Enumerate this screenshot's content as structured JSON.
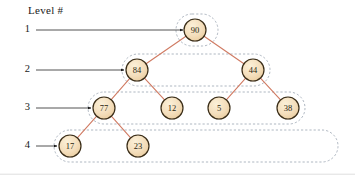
{
  "figure": {
    "caption_label": "Level #",
    "levels": [
      {
        "number": "1",
        "arrow_from_x": 36,
        "arrow_to_x": 183,
        "y": 30
      },
      {
        "number": "2",
        "arrow_from_x": 36,
        "arrow_to_x": 124,
        "y": 70
      },
      {
        "number": "3",
        "arrow_from_x": 36,
        "arrow_to_x": 91,
        "y": 108
      },
      {
        "number": "4",
        "arrow_from_x": 36,
        "arrow_to_x": 57,
        "y": 146
      }
    ],
    "nodes": [
      {
        "id": "n90",
        "label": "90",
        "cx": 195,
        "cy": 30,
        "level": 1
      },
      {
        "id": "n84",
        "label": "84",
        "cx": 137,
        "cy": 70,
        "level": 2
      },
      {
        "id": "n44",
        "label": "44",
        "cx": 253,
        "cy": 70,
        "level": 2
      },
      {
        "id": "n77",
        "label": "77",
        "cx": 104,
        "cy": 108,
        "level": 3
      },
      {
        "id": "n12",
        "label": "12",
        "cx": 172,
        "cy": 108,
        "level": 3
      },
      {
        "id": "n5",
        "label": "5",
        "cx": 219,
        "cy": 108,
        "level": 3
      },
      {
        "id": "n38",
        "label": "38",
        "cx": 288,
        "cy": 108,
        "level": 3
      },
      {
        "id": "n17",
        "label": "17",
        "cx": 70,
        "cy": 146,
        "level": 4
      },
      {
        "id": "n23",
        "label": "23",
        "cx": 138,
        "cy": 146,
        "level": 4
      }
    ],
    "edges": [
      {
        "from": "n90",
        "to": "n84"
      },
      {
        "from": "n90",
        "to": "n44"
      },
      {
        "from": "n84",
        "to": "n77"
      },
      {
        "from": "n84",
        "to": "n12"
      },
      {
        "from": "n44",
        "to": "n5"
      },
      {
        "from": "n44",
        "to": "n38"
      },
      {
        "from": "n77",
        "to": "n17"
      },
      {
        "from": "n77",
        "to": "n23"
      }
    ],
    "level_enclosures": [
      {
        "level": 1,
        "x": 176,
        "y": 14,
        "width": 42,
        "height": 32
      },
      {
        "level": 2,
        "x": 122,
        "y": 54,
        "width": 148,
        "height": 32
      },
      {
        "level": 3,
        "x": 88,
        "y": 92,
        "width": 217,
        "height": 32
      },
      {
        "level": 4,
        "x": 54,
        "y": 130,
        "width": 284,
        "height": 32
      }
    ],
    "colors": {
      "node_fill": "#f4debc",
      "node_fill_highlight": "#f8ecd2",
      "node_stroke": "#3a2d18",
      "edge": "#d07a62",
      "enclosure": "#9aa5b1",
      "arrow": "#1a1a1a",
      "rule": "#cccccc",
      "text": "#1a1a1a"
    }
  },
  "chart_data": {
    "type": "diagram",
    "structure": "binary-tree",
    "root": "90",
    "levels": {
      "1": [
        "90"
      ],
      "2": [
        "84",
        "44"
      ],
      "3": [
        "77",
        "12",
        "5",
        "38"
      ],
      "4": [
        "17",
        "23"
      ]
    },
    "edges": [
      [
        "90",
        "84"
      ],
      [
        "90",
        "44"
      ],
      [
        "84",
        "77"
      ],
      [
        "84",
        "12"
      ],
      [
        "44",
        "5"
      ],
      [
        "44",
        "38"
      ],
      [
        "77",
        "17"
      ],
      [
        "77",
        "23"
      ]
    ],
    "node_values": [
      "90",
      "84",
      "44",
      "77",
      "12",
      "5",
      "38",
      "17",
      "23"
    ],
    "annotations": [
      "Level #",
      "1",
      "2",
      "3",
      "4"
    ]
  }
}
